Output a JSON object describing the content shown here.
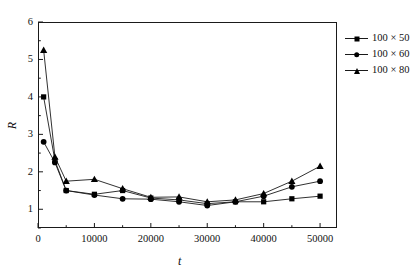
{
  "chart_data": {
    "type": "line",
    "title": "",
    "xlabel": "t",
    "ylabel": "R",
    "xlim": [
      0,
      53000
    ],
    "ylim": [
      0.5,
      6
    ],
    "grid": false,
    "legend_position": "right-top-outside",
    "x_ticks_major": [
      0,
      10000,
      20000,
      30000,
      40000,
      50000
    ],
    "x_tick_labels": [
      "0",
      "10000",
      "20000",
      "30000",
      "40000",
      "50000"
    ],
    "x_ticks_minor": [
      5000,
      15000,
      25000,
      35000,
      45000
    ],
    "y_ticks_major": [
      1,
      2,
      3,
      4,
      5,
      6
    ],
    "y_tick_labels": [
      "1",
      "2",
      "3",
      "4",
      "5",
      "6"
    ],
    "y_ticks_minor": [
      0.5,
      1.5,
      2.5,
      3.5,
      4.5,
      5.5
    ],
    "series": [
      {
        "name": "100 × 50",
        "marker": "square",
        "x": [
          1000,
          3000,
          5000,
          10000,
          15000,
          20000,
          25000,
          30000,
          35000,
          40000,
          45000,
          50000
        ],
        "values": [
          4.0,
          2.3,
          1.5,
          1.4,
          1.5,
          1.3,
          1.25,
          1.15,
          1.2,
          1.2,
          1.28,
          1.35
        ]
      },
      {
        "name": "100 × 60",
        "marker": "circle",
        "x": [
          1000,
          3000,
          5000,
          10000,
          15000,
          20000,
          25000,
          30000,
          35000,
          40000,
          45000,
          50000
        ],
        "values": [
          2.8,
          2.25,
          1.5,
          1.38,
          1.28,
          1.27,
          1.2,
          1.1,
          1.2,
          1.35,
          1.6,
          1.75
        ]
      },
      {
        "name": "100 × 80",
        "marker": "triangle",
        "x": [
          1000,
          3000,
          5000,
          10000,
          15000,
          20000,
          25000,
          30000,
          35000,
          40000,
          45000,
          50000
        ],
        "values": [
          5.25,
          2.4,
          1.75,
          1.8,
          1.55,
          1.32,
          1.33,
          1.2,
          1.25,
          1.42,
          1.75,
          2.15
        ]
      }
    ]
  },
  "legend": {
    "items": [
      {
        "label": "100 × 50",
        "marker": "square"
      },
      {
        "label": "100 × 60",
        "marker": "circle"
      },
      {
        "label": "100 × 80",
        "marker": "triangle"
      }
    ]
  },
  "axes": {
    "y_title": "R",
    "x_title": "t"
  },
  "colors": {
    "line": "#1a1a1a",
    "marker": "#000000",
    "frame": "#1a1a1a",
    "background": "#ffffff"
  }
}
